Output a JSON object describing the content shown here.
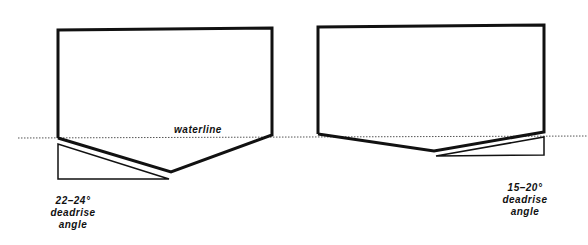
{
  "diagram": {
    "waterline_label": "waterline",
    "left_hull": {
      "angle": "22–24°",
      "line2": "deadrise",
      "line3": "angle"
    },
    "right_hull": {
      "angle": "15–20°",
      "line2": "deadrise",
      "line3": "angle"
    }
  },
  "colors": {
    "stroke": "#111111",
    "background": "#ffffff"
  }
}
